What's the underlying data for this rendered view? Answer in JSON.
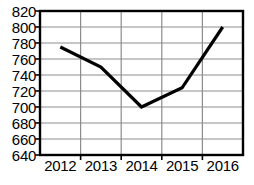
{
  "chart_data": {
    "type": "line",
    "title": "",
    "xlabel": "",
    "ylabel": "",
    "categories": [
      "2012",
      "2013",
      "2014",
      "2015",
      "2016"
    ],
    "values": [
      775,
      750,
      700,
      724,
      800
    ],
    "series": [
      {
        "name": "",
        "values": [
          775,
          750,
          700,
          724,
          800
        ]
      }
    ],
    "ylim": [
      640,
      820
    ],
    "y_ticks": [
      640,
      660,
      680,
      700,
      720,
      740,
      760,
      780,
      800,
      820
    ],
    "y_tick_labels": [
      "640",
      "660",
      "680",
      "700",
      "720",
      "740",
      "760",
      "780",
      "800",
      "820"
    ],
    "x_tick_labels": [
      "2012",
      "2013",
      "2014",
      "2015",
      "2016"
    ],
    "grid": true,
    "legend": false,
    "legend_position": "none",
    "line_color": "#000000",
    "grid_color": "#8c8c8c",
    "axis_color": "#000000",
    "background_color": "#ffffff"
  }
}
